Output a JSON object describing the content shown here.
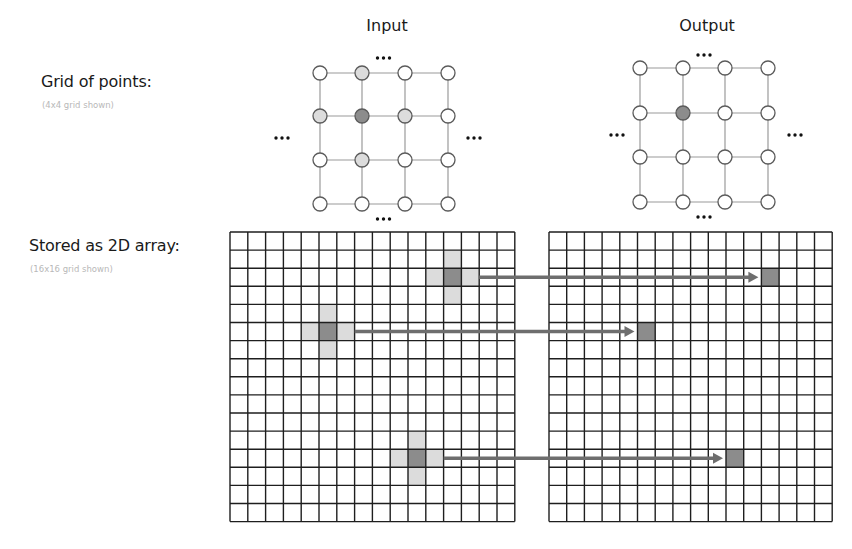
{
  "labels": {
    "grid_of_points": "Grid of points:",
    "grid_of_points_sub": "(4x4 grid shown)",
    "stored_as_array": "Stored as 2D array:",
    "stored_as_array_sub": "(16x16 grid shown)"
  },
  "panels": {
    "input_title": "Input",
    "output_title": "Output"
  },
  "ellipsis": "•••",
  "colors": {
    "dark_fill": "#8c8c8c",
    "light_fill": "#dcdcdc",
    "node_stroke": "#5a5a5a",
    "edge": "#9a9a9a",
    "grid_line": "#1e1e1e",
    "arrow": "#6e6e6e"
  },
  "point_grids": {
    "input": {
      "size": 4,
      "x": [
        320,
        362,
        405,
        448
      ],
      "y": [
        73,
        116,
        160,
        204
      ],
      "dark": [
        [
          1,
          1
        ]
      ],
      "light": [
        [
          1,
          0
        ],
        [
          0,
          1
        ],
        [
          2,
          1
        ],
        [
          1,
          2
        ]
      ]
    },
    "output": {
      "size": 4,
      "x": [
        640,
        683,
        725,
        768
      ],
      "y": [
        68,
        113,
        157,
        202
      ],
      "dark": [
        [
          1,
          1
        ]
      ],
      "light": []
    }
  },
  "arrays": {
    "size": 16,
    "input": {
      "x0": 230,
      "y0": 232,
      "cell": 17.8
    },
    "output": {
      "x0": 549,
      "y0": 232,
      "cell": 17.7
    },
    "stencils": [
      {
        "col": 12,
        "row": 2
      },
      {
        "col": 5,
        "row": 5
      },
      {
        "col": 10,
        "row": 12
      }
    ]
  }
}
